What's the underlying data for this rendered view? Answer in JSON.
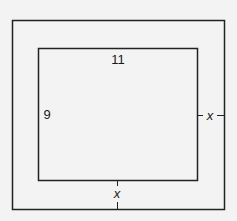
{
  "diagram": {
    "type": "nested-rectangles",
    "colors": {
      "background": "#f3f3f3",
      "stroke": "#222222",
      "text": "#1a1a1a"
    },
    "outer_rectangle": {
      "label": "outer frame"
    },
    "inner_rectangle": {
      "width_label": "11",
      "height_label": "9"
    },
    "border_width_labels": {
      "right": "x",
      "bottom": "x"
    }
  }
}
